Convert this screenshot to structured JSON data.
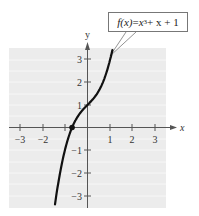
{
  "chart_data": {
    "type": "line",
    "title": "",
    "function_label": "f(x) = x^3 + x + 1",
    "function_parts": {
      "lhs": "f(x)",
      "eq": " = ",
      "x1": "x",
      "exp": "3",
      "rest": " + x + 1"
    },
    "xlabel": "x",
    "ylabel": "y",
    "xlim": [
      -3.5,
      3.5
    ],
    "ylim": [
      -3.5,
      3.5
    ],
    "x_ticks": [
      -3,
      -2,
      1,
      2,
      3
    ],
    "x_tick_labels": [
      "−3",
      "−2",
      "1",
      "2",
      "3"
    ],
    "y_ticks": [
      -3,
      -2,
      -1,
      1,
      2,
      3
    ],
    "y_tick_labels": [
      "−3",
      "−2",
      "−1",
      "1",
      "2",
      "3"
    ],
    "grid": true,
    "series": [
      {
        "name": "f(x) = x^3 + x + 1",
        "x": [
          -1.57,
          -1.5,
          -1.25,
          -1.0,
          -0.75,
          -0.5,
          -0.25,
          0.0,
          0.25,
          0.5,
          0.75,
          1.0,
          1.1
        ],
        "y": [
          -4.44,
          -3.88,
          -2.2,
          -1.0,
          -0.17,
          0.38,
          0.73,
          1.0,
          1.27,
          1.63,
          2.17,
          3.0,
          3.43
        ]
      }
    ],
    "annotations": [
      {
        "type": "point",
        "x": -0.68,
        "y": 0,
        "label": "real zero"
      },
      {
        "type": "callout",
        "text": "f(x) = x^3 + x + 1",
        "points_to": [
          1.0,
          3.0
        ]
      }
    ]
  }
}
